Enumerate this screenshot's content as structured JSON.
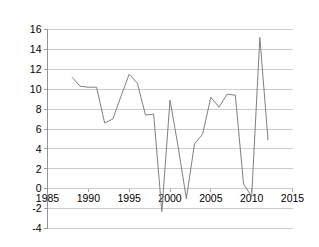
{
  "chart_data": {
    "type": "line",
    "title": "",
    "subtitle": "",
    "xlabel": "",
    "ylabel": "",
    "grid": "horizontal",
    "legend": "none",
    "xlim": [
      1985,
      2015
    ],
    "ylim": [
      -4,
      16
    ],
    "x_ticks": [
      "1985",
      "1990",
      "1995",
      "2000",
      "2005",
      "2010",
      "2015"
    ],
    "x_tick_values": [
      1985,
      1990,
      1995,
      2000,
      2005,
      2010,
      2015
    ],
    "y_ticks": [
      "-4",
      "-2",
      "0",
      "2",
      "4",
      "6",
      "8",
      "10",
      "12",
      "14",
      "16"
    ],
    "y_tick_values": [
      -4,
      -2,
      0,
      2,
      4,
      6,
      8,
      10,
      12,
      14,
      16
    ],
    "line_color": "#808080",
    "grid_color": "#b8b8b8",
    "axis_color": "#8a8a8a",
    "series": [
      {
        "name": "series-1",
        "x": [
          1988,
          1989,
          1990,
          1991,
          1992,
          1993,
          1994,
          1995,
          1996,
          1997,
          1998,
          1999,
          2000,
          2001,
          2002,
          2003,
          2004,
          2005,
          2006,
          2007,
          2008,
          2009,
          2010,
          2011,
          2012
        ],
        "values": [
          11.2,
          10.3,
          10.2,
          10.2,
          6.6,
          7.0,
          9.3,
          11.5,
          10.6,
          7.4,
          7.5,
          -2.3,
          8.9,
          4.2,
          -1.0,
          4.5,
          5.5,
          9.2,
          8.2,
          9.5,
          9.4,
          0.5,
          -0.8,
          15.2,
          4.9
        ]
      }
    ]
  }
}
